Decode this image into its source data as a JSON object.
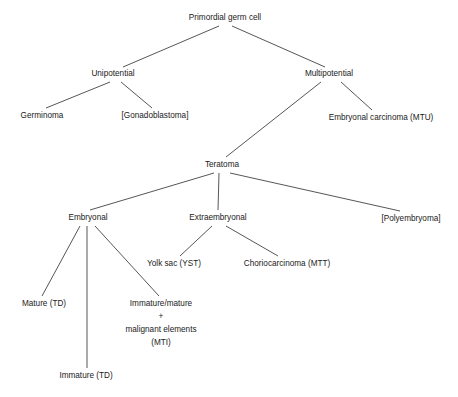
{
  "diagram": {
    "type": "tree",
    "stroke_color": "#2b2b2b",
    "text_color": "#1a1a1a",
    "background_color": "#ffffff",
    "nodes": [
      {
        "id": "primordial",
        "label": "Primordial germ cell",
        "x": 225,
        "y": 18,
        "level": 0
      },
      {
        "id": "unipotential",
        "label": "Unipotential",
        "x": 113,
        "y": 74,
        "level": 1
      },
      {
        "id": "multipotential",
        "label": "Multipotential",
        "x": 329,
        "y": 74,
        "level": 1
      },
      {
        "id": "germinoma",
        "label": "Germinoma",
        "x": 42,
        "y": 116,
        "level": 2
      },
      {
        "id": "gonadoblastoma",
        "label": "[Gonadoblastoma]",
        "x": 155,
        "y": 116,
        "level": 2
      },
      {
        "id": "embryonal-ca",
        "label": "Embryonal carcinoma (MTU)",
        "x": 381,
        "y": 118,
        "level": 2
      },
      {
        "id": "teratoma",
        "label": "Teratoma",
        "x": 222,
        "y": 165,
        "level": 2
      },
      {
        "id": "embryonal",
        "label": "Embryonal",
        "x": 88,
        "y": 218,
        "level": 3
      },
      {
        "id": "extraembryonal",
        "label": "Extraembryonal",
        "x": 218,
        "y": 218,
        "level": 3
      },
      {
        "id": "polyembryoma",
        "label": "[Polyembryoma]",
        "x": 411,
        "y": 219,
        "level": 3
      },
      {
        "id": "yolk-sac",
        "label": "Yolk sac (YST)",
        "x": 174,
        "y": 264,
        "level": 4
      },
      {
        "id": "choriocarcinoma",
        "label": "Choriocarcinoma (MTT)",
        "x": 287,
        "y": 264,
        "level": 4
      },
      {
        "id": "mature-td",
        "label": "Mature (TD)",
        "x": 44,
        "y": 304,
        "level": 4
      },
      {
        "id": "immature-td",
        "label": "Immature (TD)",
        "x": 86,
        "y": 376,
        "level": 4
      }
    ],
    "multiline_nodes": [
      {
        "id": "mti-block",
        "x": 161,
        "y": 304,
        "line_height": 13,
        "lines": [
          "Immature/mature",
          "+",
          "malignant elements",
          "(MTI)"
        ]
      }
    ],
    "edges": [
      {
        "id": "primordial-unipotential",
        "from": "primordial",
        "to": "unipotential",
        "x1": 219,
        "y1": 26,
        "x2": 123,
        "y2": 67
      },
      {
        "id": "primordial-multipotential",
        "from": "primordial",
        "to": "multipotential",
        "x1": 232,
        "y1": 26,
        "x2": 325,
        "y2": 67
      },
      {
        "id": "unipotential-germinoma",
        "from": "unipotential",
        "to": "germinoma",
        "x1": 110,
        "y1": 82,
        "x2": 46,
        "y2": 108
      },
      {
        "id": "unipotential-gonadoblastoma",
        "from": "unipotential",
        "to": "gonadoblastoma",
        "x1": 121,
        "y1": 82,
        "x2": 152,
        "y2": 108
      },
      {
        "id": "multipotential-teratoma",
        "from": "multipotential",
        "to": "teratoma",
        "x1": 321,
        "y1": 82,
        "x2": 226,
        "y2": 157
      },
      {
        "id": "multipotential-embryonalca",
        "from": "multipotential",
        "to": "embryonal-ca",
        "x1": 341,
        "y1": 82,
        "x2": 372,
        "y2": 110
      },
      {
        "id": "teratoma-embryonal",
        "from": "teratoma",
        "to": "embryonal",
        "x1": 214,
        "y1": 173,
        "x2": 90,
        "y2": 210
      },
      {
        "id": "teratoma-extraembryonal",
        "from": "teratoma",
        "to": "extraembryonal",
        "x1": 219,
        "y1": 173,
        "x2": 218,
        "y2": 210
      },
      {
        "id": "teratoma-polyembryoma",
        "from": "teratoma",
        "to": "polyembryoma",
        "x1": 230,
        "y1": 173,
        "x2": 400,
        "y2": 211
      },
      {
        "id": "embryonal-mature",
        "from": "embryonal",
        "to": "mature-td",
        "x1": 80,
        "y1": 226,
        "x2": 42,
        "y2": 296
      },
      {
        "id": "embryonal-immature",
        "from": "embryonal",
        "to": "immature-td",
        "x1": 87,
        "y1": 226,
        "x2": 87,
        "y2": 368
      },
      {
        "id": "embryonal-mti",
        "from": "embryonal",
        "to": "mti-block",
        "x1": 95,
        "y1": 226,
        "x2": 159,
        "y2": 296
      },
      {
        "id": "extraembryonal-yolksac",
        "from": "extraembryonal",
        "to": "yolk-sac",
        "x1": 212,
        "y1": 226,
        "x2": 180,
        "y2": 256
      },
      {
        "id": "extraembryonal-chorio",
        "from": "extraembryonal",
        "to": "choriocarcinoma",
        "x1": 226,
        "y1": 226,
        "x2": 278,
        "y2": 256
      }
    ]
  }
}
